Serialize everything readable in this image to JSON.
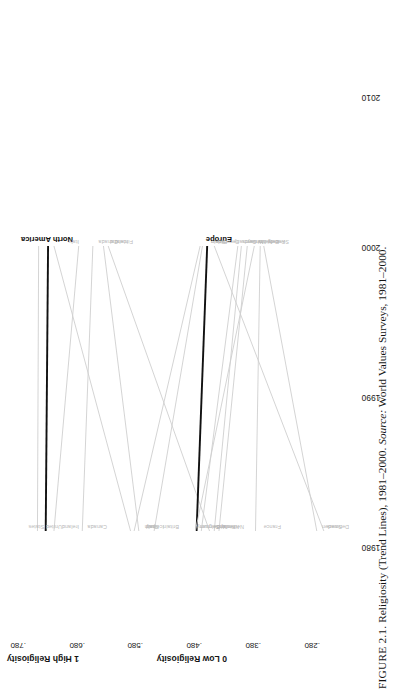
{
  "figure": {
    "caption_prefix": "FIGURE 2.1.",
    "caption_title": "Religiosity (Trend Lines), 1981–2000.",
    "caption_source_label": "Source:",
    "caption_source_value": "World Values Surveys, 1981–2000."
  },
  "axes": {
    "y_title_high": "1 High Religiosity",
    "y_title_low": "0 Low Religiosity",
    "y_ticks": [
      ".780",
      ".680",
      ".580",
      ".480",
      ".380",
      ".280"
    ],
    "x_ticks": [
      "1980",
      "1990",
      "2000",
      "2010"
    ]
  },
  "chart_data": {
    "type": "line",
    "title": "Religiosity (Trend Lines), 1981–2000",
    "xlabel": "",
    "ylabel": "Religiosity (1 High – 0 Low)",
    "xlim": [
      1976,
      2012
    ],
    "ylim": [
      0.26,
      0.82
    ],
    "x_tick_values": [
      1980,
      1990,
      2000,
      2010
    ],
    "y_tick_values": [
      0.78,
      0.68,
      0.58,
      0.48,
      0.38,
      0.28
    ],
    "grid": false,
    "legend": "inline end-labels",
    "x": [
      1981,
      2000
    ],
    "series": [
      {
        "name": "United States",
        "start_label": "United States",
        "end_label": "",
        "values": [
          0.77,
          0.768
        ],
        "emphasis": false
      },
      {
        "name": "North America",
        "start_label": "",
        "end_label": "North America",
        "values": [
          0.756,
          0.752
        ],
        "emphasis": true
      },
      {
        "name": "Ireland",
        "start_label": "Ireland",
        "end_label": "",
        "values": [
          0.742,
          0.7
        ],
        "emphasis": false
      },
      {
        "name": "Italy",
        "start_label": "Italy",
        "end_label": "Italy",
        "values": [
          0.612,
          0.742
        ],
        "emphasis": false
      },
      {
        "name": "Canada",
        "start_label": "Canada",
        "end_label": "Canada",
        "values": [
          0.694,
          0.676
        ],
        "emphasis": false
      },
      {
        "name": "Spain",
        "start_label": "Spain",
        "end_label": "Spain",
        "values": [
          0.606,
          0.494
        ],
        "emphasis": false
      },
      {
        "name": "Iceland",
        "start_label": "Iceland",
        "end_label": "Iceland",
        "values": [
          0.598,
          0.658
        ],
        "emphasis": false
      },
      {
        "name": "Finland",
        "start_label": "Finland",
        "end_label": "Finland",
        "values": [
          0.478,
          0.65
        ],
        "emphasis": false
      },
      {
        "name": "Britain",
        "start_label": "Britain",
        "end_label": "Britain",
        "values": [
          0.572,
          0.49
        ],
        "emphasis": false
      },
      {
        "name": "Europe",
        "start_label": "",
        "end_label": "Europe",
        "values": [
          0.5,
          0.482
        ],
        "emphasis": true
      },
      {
        "name": "Belgium",
        "start_label": "Belgium",
        "end_label": "Belgium",
        "values": [
          0.502,
          0.402
        ],
        "emphasis": false
      },
      {
        "name": "W. Germany",
        "start_label": "W.Germany",
        "end_label": "W.Germany",
        "values": [
          0.492,
          0.43
        ],
        "emphasis": false
      },
      {
        "name": "Denmark",
        "start_label": "Denmark",
        "end_label": "Denmark",
        "values": [
          0.284,
          0.47
        ],
        "emphasis": false
      },
      {
        "name": "Norway",
        "start_label": "Norway",
        "end_label": "Norway",
        "values": [
          0.47,
          0.424
        ],
        "emphasis": false
      },
      {
        "name": "Netherlands",
        "start_label": "Netherlands",
        "end_label": "Netherlands",
        "values": [
          0.462,
          0.414
        ],
        "emphasis": false
      },
      {
        "name": "France",
        "start_label": "France",
        "end_label": "France",
        "values": [
          0.4,
          0.392
        ],
        "emphasis": false
      },
      {
        "name": "Sweden",
        "start_label": "Sweden",
        "end_label": "Sweden",
        "values": [
          0.296,
          0.386
        ],
        "emphasis": false
      }
    ]
  }
}
